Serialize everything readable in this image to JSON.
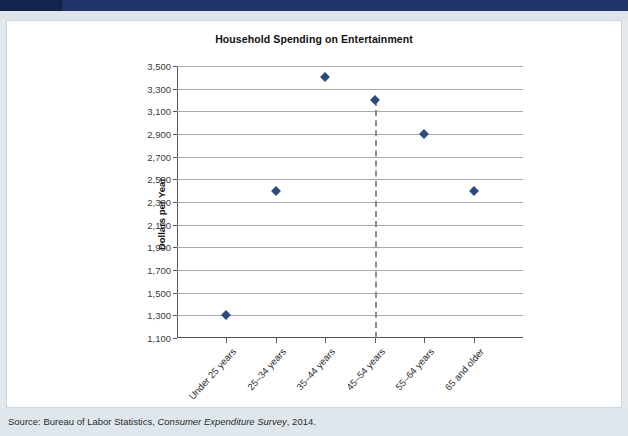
{
  "figure_header": {
    "number": "",
    "label": ""
  },
  "chart_data": {
    "type": "scatter",
    "title": "Household Spending on Entertainment",
    "xlabel": "Age of Head of Household",
    "ylabel": "Dollars per Year",
    "categories": [
      "Under 25 years",
      "25–34 years",
      "35–44 years",
      "45–54 years",
      "55–64 years",
      "65 and older"
    ],
    "values": [
      1300,
      2400,
      3400,
      3200,
      2900,
      2400
    ],
    "ylim": [
      1100,
      3500
    ],
    "ytick_step": 200,
    "ytick_labels": [
      "3,500",
      "3,300",
      "3,100",
      "2,900",
      "2,700",
      "2,500",
      "2,300",
      "2,100",
      "1,900",
      "1,700",
      "1,500",
      "1,300",
      "1,100"
    ],
    "grid": true,
    "legend": "none",
    "marker_shape": "diamond",
    "marker_color": "#2c4a7c",
    "annotations": [
      {
        "type": "vertical-dashed-line",
        "category": "45–54 years",
        "from_value": 3200,
        "to_value": 1100
      }
    ]
  },
  "footer": {
    "source_prefix": "Source: Bureau of Labor Statistics, ",
    "source_italic": "Consumer Expenditure Survey",
    "source_suffix": ", 2014."
  }
}
